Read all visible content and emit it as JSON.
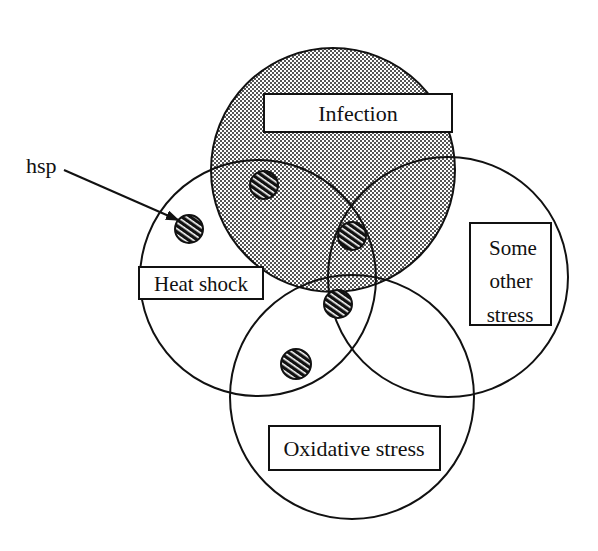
{
  "diagram": {
    "type": "venn",
    "sets": [
      {
        "id": "infection",
        "label": "Infection",
        "shaded": true
      },
      {
        "id": "heat_shock",
        "label": "Heat shock",
        "shaded": false
      },
      {
        "id": "other_stress",
        "label_lines": [
          "Some",
          "other",
          "stress"
        ],
        "shaded": false
      },
      {
        "id": "oxidative",
        "label": "Oxidative stress",
        "shaded": false
      }
    ],
    "pointer": {
      "label": "hsp",
      "target": "hsp dot in Heat shock region"
    },
    "hsp_dots": 5,
    "colors": {
      "line": "#111111",
      "shade": "#9a9a9a",
      "background": "#ffffff"
    }
  }
}
